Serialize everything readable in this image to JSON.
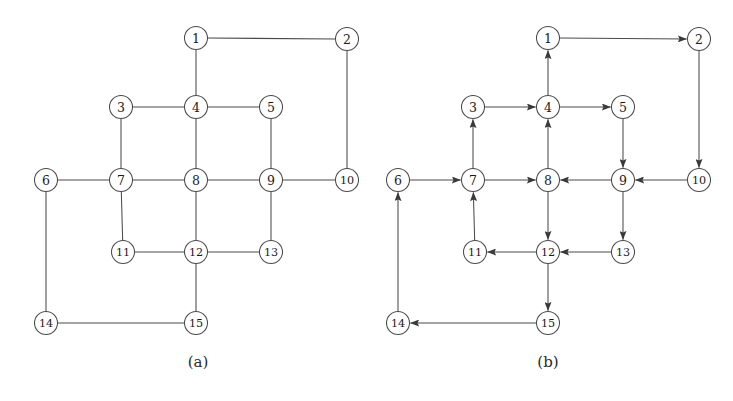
{
  "figure": {
    "background_color": "#ffffff",
    "stroke_color": "#4a4a4a",
    "label_color": "#1a1a1a",
    "node_radius": 11.5,
    "panels": [
      {
        "id": "panel-a",
        "caption": "(a)",
        "caption_x": 198,
        "caption_y": 362,
        "directed": false,
        "nodes": [
          {
            "id": 1,
            "label": "1",
            "x": 196,
            "y": 38
          },
          {
            "id": 2,
            "label": "2",
            "x": 347,
            "y": 39
          },
          {
            "id": 3,
            "label": "3",
            "x": 121,
            "y": 107
          },
          {
            "id": 4,
            "label": "4",
            "x": 196,
            "y": 107
          },
          {
            "id": 5,
            "label": "5",
            "x": 271,
            "y": 107
          },
          {
            "id": 6,
            "label": "6",
            "x": 46,
            "y": 180
          },
          {
            "id": 7,
            "label": "7",
            "x": 121,
            "y": 180
          },
          {
            "id": 8,
            "label": "8",
            "x": 196,
            "y": 180
          },
          {
            "id": 9,
            "label": "9",
            "x": 271,
            "y": 180
          },
          {
            "id": 10,
            "label": "10",
            "x": 347,
            "y": 180
          },
          {
            "id": 11,
            "label": "11",
            "x": 123,
            "y": 252
          },
          {
            "id": 12,
            "label": "12",
            "x": 196,
            "y": 252
          },
          {
            "id": 13,
            "label": "13",
            "x": 271,
            "y": 252
          },
          {
            "id": 14,
            "label": "14",
            "x": 46,
            "y": 323
          },
          {
            "id": 15,
            "label": "15",
            "x": 196,
            "y": 323
          }
        ],
        "edges": [
          {
            "from": 1,
            "to": 2
          },
          {
            "from": 1,
            "to": 4
          },
          {
            "from": 2,
            "to": 10
          },
          {
            "from": 3,
            "to": 4
          },
          {
            "from": 3,
            "to": 7
          },
          {
            "from": 4,
            "to": 5
          },
          {
            "from": 4,
            "to": 8
          },
          {
            "from": 5,
            "to": 9
          },
          {
            "from": 6,
            "to": 7
          },
          {
            "from": 6,
            "to": 14
          },
          {
            "from": 7,
            "to": 8
          },
          {
            "from": 7,
            "to": 11
          },
          {
            "from": 8,
            "to": 9
          },
          {
            "from": 8,
            "to": 12
          },
          {
            "from": 9,
            "to": 10
          },
          {
            "from": 9,
            "to": 13
          },
          {
            "from": 11,
            "to": 12
          },
          {
            "from": 12,
            "to": 13
          },
          {
            "from": 12,
            "to": 15
          },
          {
            "from": 14,
            "to": 15
          }
        ]
      },
      {
        "id": "panel-b",
        "caption": "(b)",
        "caption_x": 548,
        "caption_y": 362,
        "directed": true,
        "nodes": [
          {
            "id": 1,
            "label": "1",
            "x": 548,
            "y": 38
          },
          {
            "id": 2,
            "label": "2",
            "x": 699,
            "y": 39
          },
          {
            "id": 3,
            "label": "3",
            "x": 473,
            "y": 107
          },
          {
            "id": 4,
            "label": "4",
            "x": 548,
            "y": 107
          },
          {
            "id": 5,
            "label": "5",
            "x": 623,
            "y": 107
          },
          {
            "id": 6,
            "label": "6",
            "x": 398,
            "y": 180
          },
          {
            "id": 7,
            "label": "7",
            "x": 473,
            "y": 180
          },
          {
            "id": 8,
            "label": "8",
            "x": 548,
            "y": 180
          },
          {
            "id": 9,
            "label": "9",
            "x": 623,
            "y": 180
          },
          {
            "id": 10,
            "label": "10",
            "x": 699,
            "y": 180
          },
          {
            "id": 11,
            "label": "11",
            "x": 475,
            "y": 252
          },
          {
            "id": 12,
            "label": "12",
            "x": 548,
            "y": 252
          },
          {
            "id": 13,
            "label": "13",
            "x": 623,
            "y": 252
          },
          {
            "id": 14,
            "label": "14",
            "x": 398,
            "y": 323
          },
          {
            "id": 15,
            "label": "15",
            "x": 548,
            "y": 323
          }
        ],
        "edges": [
          {
            "from": 1,
            "to": 2
          },
          {
            "from": 4,
            "to": 1
          },
          {
            "from": 2,
            "to": 10
          },
          {
            "from": 3,
            "to": 4
          },
          {
            "from": 7,
            "to": 3
          },
          {
            "from": 4,
            "to": 5
          },
          {
            "from": 8,
            "to": 4
          },
          {
            "from": 5,
            "to": 9
          },
          {
            "from": 6,
            "to": 7
          },
          {
            "from": 14,
            "to": 6
          },
          {
            "from": 7,
            "to": 8
          },
          {
            "from": 11,
            "to": 7
          },
          {
            "from": 9,
            "to": 8
          },
          {
            "from": 8,
            "to": 12
          },
          {
            "from": 10,
            "to": 9
          },
          {
            "from": 9,
            "to": 13
          },
          {
            "from": 12,
            "to": 11
          },
          {
            "from": 13,
            "to": 12
          },
          {
            "from": 12,
            "to": 15
          },
          {
            "from": 15,
            "to": 14
          }
        ]
      }
    ]
  }
}
